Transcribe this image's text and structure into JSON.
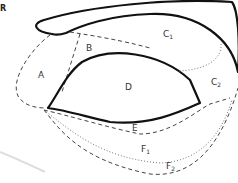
{
  "figure": {
    "type": "eye-region-zone-diagram",
    "corner_mark": "R",
    "labels": {
      "A": "A",
      "B": "B",
      "C1": {
        "main": "C",
        "sub": "1"
      },
      "C2": {
        "main": "C",
        "sub": "2"
      },
      "D": "D",
      "E": "E",
      "F1": {
        "main": "F",
        "sub": "1"
      },
      "F2": {
        "main": "F",
        "sub": "2"
      }
    },
    "colors": {
      "outline": "#111111",
      "dashed": "#444444",
      "dotted": "#777777",
      "label": "#333333"
    },
    "line_styles": {
      "eyebrow": "thick-solid",
      "eye_outline": "thick-solid",
      "zone_A": "dashed",
      "zone_B": "dashed",
      "zone_C1_C2_divider": "dotted",
      "zone_E": "dashed",
      "zone_F1": "dotted",
      "zone_F2": "dashed"
    }
  }
}
